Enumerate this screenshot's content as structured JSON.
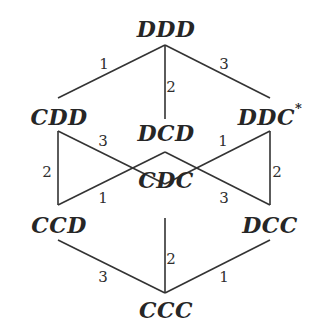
{
  "diagram": {
    "line_color": "#333333",
    "text_color": "#262626",
    "nodes": [
      {
        "id": "DDD",
        "label": "DDD",
        "sup": "",
        "x": 166,
        "y": 29
      },
      {
        "id": "CDD",
        "label": "CDD",
        "sup": "",
        "x": 59,
        "y": 117
      },
      {
        "id": "DCD",
        "label": "DCD",
        "sup": "",
        "x": 166,
        "y": 133
      },
      {
        "id": "DDC",
        "label": "DDC",
        "sup": "*",
        "x": 270,
        "y": 117
      },
      {
        "id": "CDC",
        "label": "CDC",
        "sup": "",
        "x": 166,
        "y": 180
      },
      {
        "id": "CCD",
        "label": "CCD",
        "sup": "",
        "x": 59,
        "y": 225
      },
      {
        "id": "DCC",
        "label": "DCC",
        "sup": "",
        "x": 270,
        "y": 225
      },
      {
        "id": "CCC",
        "label": "CCC",
        "sup": "",
        "x": 166,
        "y": 310
      }
    ],
    "edges": [
      {
        "from": "DDD",
        "to": "CDD",
        "label": "1",
        "x1": 165,
        "y1": 45,
        "x2": 58,
        "y2": 98,
        "lx": 104,
        "ly": 64
      },
      {
        "from": "DDD",
        "to": "DCD",
        "label": "2",
        "x1": 165,
        "y1": 45,
        "x2": 165,
        "y2": 119,
        "lx": 171,
        "ly": 87
      },
      {
        "from": "DDD",
        "to": "DDC",
        "label": "3",
        "x1": 165,
        "y1": 45,
        "x2": 270,
        "y2": 98,
        "lx": 224,
        "ly": 64
      },
      {
        "from": "CDD",
        "to": "CCD",
        "label": "2",
        "x1": 58,
        "y1": 131,
        "x2": 58,
        "y2": 205,
        "lx": 47,
        "ly": 172
      },
      {
        "from": "CDD",
        "to": "CDC",
        "label": "3",
        "x1": 58,
        "y1": 131,
        "x2": 165,
        "y2": 184,
        "lx": 103,
        "ly": 141
      },
      {
        "from": "CCD",
        "to": "DCD",
        "label": "1",
        "x1": 58,
        "y1": 205,
        "x2": 165,
        "y2": 152,
        "lx": 103,
        "ly": 198
      },
      {
        "from": "DDC",
        "to": "CDC",
        "label": "1",
        "x1": 270,
        "y1": 131,
        "x2": 165,
        "y2": 184,
        "lx": 223,
        "ly": 141
      },
      {
        "from": "DDC",
        "to": "DCC",
        "label": "2",
        "x1": 270,
        "y1": 131,
        "x2": 270,
        "y2": 205,
        "lx": 277,
        "ly": 172
      },
      {
        "from": "DCC",
        "to": "DCD",
        "label": "3",
        "x1": 270,
        "y1": 205,
        "x2": 165,
        "y2": 152,
        "lx": 224,
        "ly": 198
      },
      {
        "from": "CCD",
        "to": "CCC",
        "label": "3",
        "x1": 58,
        "y1": 240,
        "x2": 165,
        "y2": 293,
        "lx": 103,
        "ly": 277
      },
      {
        "from": "CDC",
        "to": "CCC",
        "label": "2",
        "x1": 165,
        "y1": 218,
        "x2": 165,
        "y2": 293,
        "lx": 171,
        "ly": 259
      },
      {
        "from": "DCC",
        "to": "CCC",
        "label": "1",
        "x1": 270,
        "y1": 240,
        "x2": 165,
        "y2": 293,
        "lx": 224,
        "ly": 277
      }
    ]
  }
}
